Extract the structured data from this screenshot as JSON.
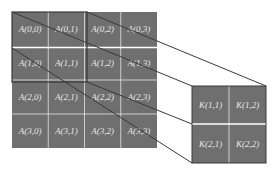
{
  "input_matrix": {
    "name": "A",
    "rows": 4,
    "cols": 4,
    "cells": [
      [
        "A(0,0)",
        "A(0,1)",
        "A(0,2)",
        "A(0,3)"
      ],
      [
        "A(1,0)",
        "A(1,1)",
        "A(1,2)",
        "A(1,3)"
      ],
      [
        "A(2,0)",
        "A(2,1)",
        "A(2,2)",
        "A(2,3)"
      ],
      [
        "A(3,0)",
        "A(3,1)",
        "A(3,2)",
        "A(3,3)"
      ]
    ]
  },
  "kernel_matrix": {
    "name": "K",
    "rows": 2,
    "cols": 2,
    "cells": [
      [
        "K(1,1)",
        "K(1,2)"
      ],
      [
        "K(2,1)",
        "K(2,2)"
      ]
    ]
  },
  "colors": {
    "cell_fill": "#6f6f6f",
    "grid_line": "#e0e0e0",
    "connector": "#3a3a3a",
    "text": "#e8e8e8"
  }
}
